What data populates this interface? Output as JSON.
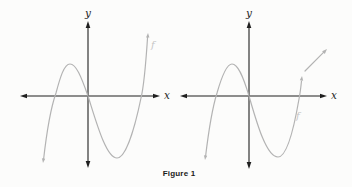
{
  "figure_caption": "Figure 1",
  "colors": {
    "background": "#fcfcfb",
    "axis": "#1f1f1f",
    "curve": "#b3b3b3",
    "curve_label": "#c6c6c6",
    "caption": "#1a1a1a"
  },
  "chart_data": [
    {
      "id": "left-graph",
      "type": "line",
      "title": "",
      "xlabel": "x",
      "ylabel": "y",
      "grid": false,
      "ticks": "none (qualitative sketch, no numeric scale shown)",
      "axes": {
        "x_axis": {
          "x1": 20,
          "x2": 160,
          "y": 96
        },
        "y_axis": {
          "x": 88,
          "y1": 21,
          "y2": 168
        }
      },
      "series": [
        {
          "name": "f",
          "shape": "cubic-like curve: rises from lower left with arrow, local maximum left of y-axis, falls through the origin, local minimum right of y-axis, rises steeply to upper right with arrow",
          "key_points_px": {
            "lower_arrow_tip": [
              43,
              163
            ],
            "x_intercept_left": [
              55,
              96
            ],
            "local_max": [
              69,
              64
            ],
            "origin_crossing": [
              88,
              96
            ],
            "local_min": [
              117,
              158
            ],
            "x_intercept_right": [
              141,
              96
            ],
            "upper_arrow_tip": [
              148,
              33
            ]
          },
          "path": "M 43.5,160 C 46,138 50,110 56,93 C 60,78 64,64 70,64 C 76,64 81,76 88,96 C 96,121 106,158 117,158 C 126,158 135,127 141,98 C 143,90 146,61 147.6,37",
          "arrowheads": [
            {
              "tip": [
                43,
                163
              ],
              "angle": 97
            },
            {
              "tip": [
                148,
                33
              ],
              "angle": -86
            }
          ],
          "label_pos": [
            151,
            48
          ]
        }
      ],
      "annotations": []
    },
    {
      "id": "right-graph",
      "type": "line",
      "title": "",
      "xlabel": "x",
      "ylabel": "y",
      "grid": false,
      "ticks": "none (qualitative sketch, no numeric scale shown)",
      "axes": {
        "x_axis": {
          "x1": 180,
          "x2": 327,
          "y": 96
        },
        "y_axis": {
          "x": 249,
          "y1": 21,
          "y2": 169
        }
      },
      "series": [
        {
          "name": "f",
          "shape": "same cubic-like curve, but the rising right branch stops just above the x-axis with a small arrow; a separate detached arrow continues up and to the right",
          "key_points_px": {
            "lower_arrow_tip": [
              205,
              160
            ],
            "x_intercept_left": [
              216,
              96
            ],
            "local_max": [
              232,
              64
            ],
            "origin_crossing": [
              249,
              96
            ],
            "local_min": [
              278,
              157
            ],
            "x_intercept_right": [
              300,
              96
            ],
            "end_arrow_tip": [
              302,
              76
            ]
          },
          "path": "M 205.5,157 C 208,136 212,109 217,93 C 221,79 226,64 232,64 C 238,64 243,76 249,96 C 256,120 266,157 278,157 C 287,157 294,128 299,99 C 300,94 301,86 301.5,81",
          "arrowheads": [
            {
              "tip": [
                205,
                160
              ],
              "angle": 97
            },
            {
              "tip": [
                302,
                76
              ],
              "angle": -84
            }
          ],
          "label_pos": [
            296,
            119
          ]
        }
      ],
      "annotations": [
        {
          "type": "arrow",
          "from": [
            305,
            71
          ],
          "tip": [
            327,
            49
          ],
          "note": "detached gray arrow indicating the graph continues up to the right"
        }
      ]
    }
  ]
}
